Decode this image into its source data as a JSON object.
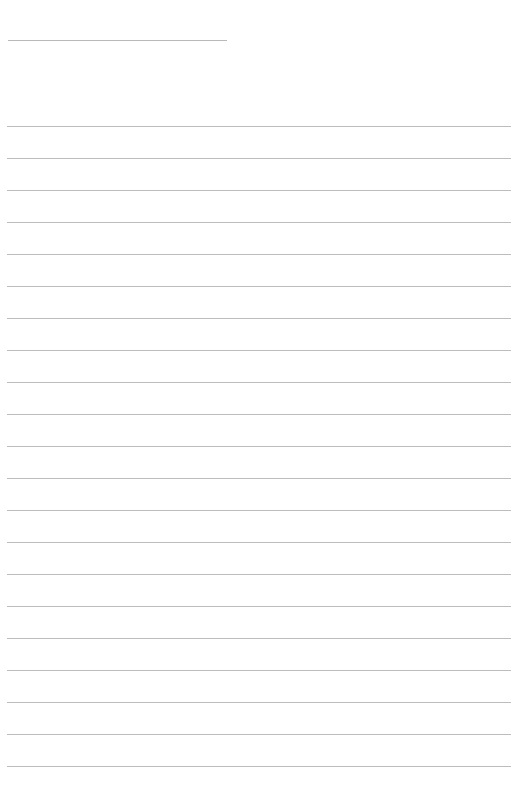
{
  "page": {
    "type": "lined-paper",
    "background": "#ffffff",
    "line_color": "#bdbdbd",
    "header_line": {
      "x": 8,
      "y": 40,
      "width": 219
    },
    "ruled_lines": {
      "count": 21,
      "first_y": 126,
      "spacing": 32,
      "x": 7,
      "width": 504
    }
  }
}
